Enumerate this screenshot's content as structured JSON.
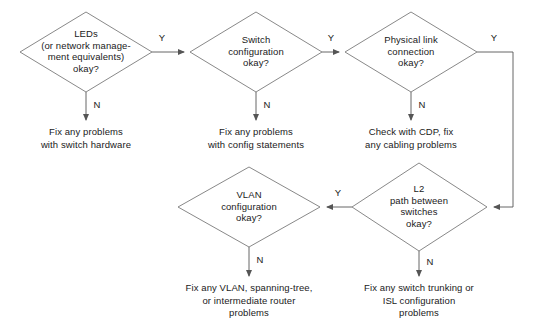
{
  "diagram": {
    "type": "flowchart",
    "line_color": "#6b6b6b",
    "text_color": "#1a1a1a",
    "background": "#ffffff",
    "decisions": [
      {
        "id": "leds",
        "text": "LEDs\n(or network manage-\nment equivalents)\nokay?"
      },
      {
        "id": "switch-config",
        "text": "Switch\nconfiguration\nokay?"
      },
      {
        "id": "physical-link",
        "text": "Physical link\nconnection\nokay?"
      },
      {
        "id": "vlan-config",
        "text": "VLAN\nconfiguration\nokay?"
      },
      {
        "id": "l2-path",
        "text": "L2\npath between\nswitches\nokay?"
      }
    ],
    "actions": [
      {
        "id": "fix-switch-hardware",
        "text": "Fix any problems\nwith switch hardware"
      },
      {
        "id": "fix-config-statements",
        "text": "Fix any problems\nwith config statements"
      },
      {
        "id": "check-cdp-cabling",
        "text": "Check with CDP, fix\nany cabling problems"
      },
      {
        "id": "fix-vlan-spanning-tree",
        "text": "Fix any VLAN, spanning-tree,\nor intermediate router\nproblems"
      },
      {
        "id": "fix-trunking-isl",
        "text": "Fix any switch trunking or\nISL configuration\nproblems"
      }
    ],
    "edge_labels": {
      "leds_yes": "Y",
      "leds_no": "N",
      "switch_config_yes": "Y",
      "switch_config_no": "N",
      "physical_link_yes": "Y",
      "physical_link_no": "N",
      "l2_path_yes": "Y",
      "l2_path_no": "N",
      "vlan_config_no": "N"
    }
  }
}
